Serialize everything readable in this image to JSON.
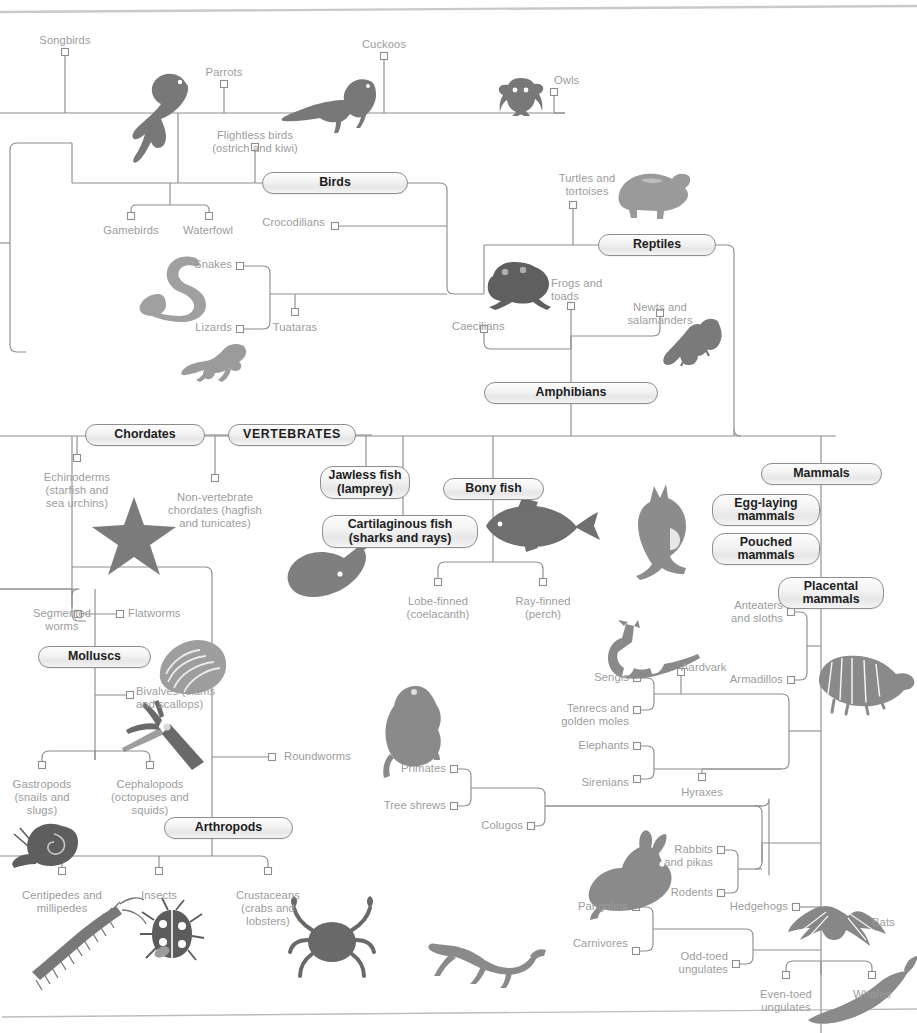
{
  "diagram": {
    "type": "cladogram",
    "colors": {
      "line": "#8e8e8e",
      "leaf_text": "#9c9c9c",
      "pill_text": "#1d1d1d",
      "pill_border": "#8e8e8e",
      "silhouette_dark": "#6e6e6e",
      "silhouette_light": "#a8a8a8",
      "page_rule": "#b9b9b9",
      "background": "#ffffff"
    }
  },
  "clades": [
    {
      "id": "birds",
      "label": "Birds",
      "x": 262,
      "y": 172,
      "w": 146,
      "h": 22
    },
    {
      "id": "reptiles",
      "label": "Reptiles",
      "x": 598,
      "y": 234,
      "w": 118,
      "h": 22
    },
    {
      "id": "amphibians",
      "label": "Amphibians",
      "x": 484,
      "y": 382,
      "w": 174,
      "h": 22
    },
    {
      "id": "chordates",
      "label": "Chordates",
      "x": 85,
      "y": 424,
      "w": 120,
      "h": 22
    },
    {
      "id": "vertebrates",
      "label": "VERTEBRATES",
      "x": 228,
      "y": 424,
      "w": 128,
      "h": 22
    },
    {
      "id": "jawless",
      "label": "Jawless fish\n(lamprey)",
      "x": 320,
      "y": 466,
      "w": 90,
      "h": 33
    },
    {
      "id": "cartilaginous",
      "label": "Cartilaginous fish\n(sharks and rays)",
      "x": 322,
      "y": 515,
      "w": 156,
      "h": 33
    },
    {
      "id": "bony",
      "label": "Bony fish",
      "x": 443,
      "y": 478,
      "w": 101,
      "h": 22
    },
    {
      "id": "mammals",
      "label": "Mammals",
      "x": 761,
      "y": 463,
      "w": 121,
      "h": 22
    },
    {
      "id": "egglaying",
      "label": "Egg-laying\nmammals",
      "x": 712,
      "y": 494,
      "w": 108,
      "h": 32
    },
    {
      "id": "pouched",
      "label": "Pouched\nmammals",
      "x": 712,
      "y": 533,
      "w": 108,
      "h": 32
    },
    {
      "id": "placental",
      "label": "Placental\nmammals",
      "x": 778,
      "y": 577,
      "w": 106,
      "h": 32
    },
    {
      "id": "molluscs",
      "label": "Molluscs",
      "x": 38,
      "y": 646,
      "w": 113,
      "h": 22
    },
    {
      "id": "arthropods",
      "label": "Arthropods",
      "x": 164,
      "y": 817,
      "w": 129,
      "h": 22
    }
  ],
  "leaves": [
    {
      "id": "songbirds",
      "label": "Songbirds",
      "x": 65,
      "y": 34,
      "align": "c"
    },
    {
      "id": "parrots",
      "label": "Parrots",
      "x": 224,
      "y": 66,
      "align": "c"
    },
    {
      "id": "cuckoos",
      "label": "Cuckoos",
      "x": 384,
      "y": 38,
      "align": "c"
    },
    {
      "id": "owls",
      "label": "Owls",
      "x": 554,
      "y": 74,
      "align": "l"
    },
    {
      "id": "flightless-birds",
      "label": "Flightless birds\n(ostrich and kiwi)",
      "x": 255,
      "y": 129,
      "align": "c"
    },
    {
      "id": "gamebirds",
      "label": "Gamebirds",
      "x": 131,
      "y": 224,
      "align": "c"
    },
    {
      "id": "waterfowl",
      "label": "Waterfowl",
      "x": 208,
      "y": 224,
      "align": "c"
    },
    {
      "id": "crocodilians",
      "label": "Crocodilians",
      "x": 325,
      "y": 216,
      "align": "r"
    },
    {
      "id": "snakes",
      "label": "Snakes",
      "x": 232,
      "y": 258,
      "align": "r"
    },
    {
      "id": "lizards",
      "label": "Lizards",
      "x": 232,
      "y": 321,
      "align": "r"
    },
    {
      "id": "tuataras",
      "label": "Tuataras",
      "x": 295,
      "y": 321,
      "align": "c"
    },
    {
      "id": "turtles",
      "label": "Turtles and\ntortoises",
      "x": 587,
      "y": 172,
      "align": "c"
    },
    {
      "id": "frogs",
      "label": "Frogs and\ntoads",
      "x": 551,
      "y": 277,
      "align": "l"
    },
    {
      "id": "newts",
      "label": "Newts and\nsalamanders",
      "x": 660,
      "y": 301,
      "align": "c"
    },
    {
      "id": "caecilians",
      "label": "Caecilians",
      "x": 452,
      "y": 320,
      "align": "l"
    },
    {
      "id": "echinoderms",
      "label": "Echinoderms\n(starfish and\nsea urchins)",
      "x": 77,
      "y": 471,
      "align": "c"
    },
    {
      "id": "non-vertebrate",
      "label": "Non-vertebrate\nchordates (hagfish\nand tunicates)",
      "x": 215,
      "y": 491,
      "align": "c"
    },
    {
      "id": "lobe-finned",
      "label": "Lobe-finned\n(coelacanth)",
      "x": 438,
      "y": 595,
      "align": "c"
    },
    {
      "id": "ray-finned",
      "label": "Ray-finned\n(perch)",
      "x": 543,
      "y": 595,
      "align": "c"
    },
    {
      "id": "segmented-worms",
      "label": "Segmented\nworms",
      "x": 62,
      "y": 607,
      "align": "c"
    },
    {
      "id": "flatworms",
      "label": "Flatworms",
      "x": 128,
      "y": 607,
      "align": "l"
    },
    {
      "id": "bivalves",
      "label": "Bivalves (clams\nand scallops)",
      "x": 136,
      "y": 685,
      "align": "l"
    },
    {
      "id": "roundworms",
      "label": "Roundworms",
      "x": 284,
      "y": 750,
      "align": "l"
    },
    {
      "id": "gastropods",
      "label": "Gastropods\n(snails and\nslugs)",
      "x": 42,
      "y": 778,
      "align": "c"
    },
    {
      "id": "cephalopods",
      "label": "Cephalopods\n(octopuses and\nsquids)",
      "x": 150,
      "y": 778,
      "align": "c"
    },
    {
      "id": "centipedes",
      "label": "Centipedes and\nmillipedes",
      "x": 62,
      "y": 889,
      "align": "c"
    },
    {
      "id": "insects",
      "label": "Insects",
      "x": 159,
      "y": 889,
      "align": "c"
    },
    {
      "id": "crustaceans",
      "label": "Crustaceans\n(crabs and\nlobsters)",
      "x": 268,
      "y": 889,
      "align": "c"
    },
    {
      "id": "anteaters",
      "label": "Anteaters\nand sloths",
      "x": 783,
      "y": 599,
      "align": "r"
    },
    {
      "id": "aardvark",
      "label": "Aardvark",
      "x": 681,
      "y": 661,
      "align": "l"
    },
    {
      "id": "armadillos",
      "label": "Armadillos",
      "x": 783,
      "y": 673,
      "align": "r"
    },
    {
      "id": "sengis",
      "label": "Sengis",
      "x": 629,
      "y": 671,
      "align": "r"
    },
    {
      "id": "tenrecs",
      "label": "Tenrecs and\ngolden moles",
      "x": 629,
      "y": 702,
      "align": "r"
    },
    {
      "id": "elephants",
      "label": "Elephants",
      "x": 629,
      "y": 739,
      "align": "r"
    },
    {
      "id": "sirenians",
      "label": "Sirenians",
      "x": 629,
      "y": 776,
      "align": "r"
    },
    {
      "id": "hyraxes",
      "label": "Hyraxes",
      "x": 702,
      "y": 786,
      "align": "c"
    },
    {
      "id": "primates",
      "label": "Primates",
      "x": 446,
      "y": 762,
      "align": "r"
    },
    {
      "id": "tree-shrews",
      "label": "Tree shrews",
      "x": 446,
      "y": 799,
      "align": "r"
    },
    {
      "id": "colugos",
      "label": "Colugos",
      "x": 523,
      "y": 819,
      "align": "r"
    },
    {
      "id": "rabbits",
      "label": "Rabbits\nand pikas",
      "x": 713,
      "y": 843,
      "align": "r"
    },
    {
      "id": "rodents",
      "label": "Rodents",
      "x": 713,
      "y": 886,
      "align": "r"
    },
    {
      "id": "pangolins",
      "label": "Pangolins",
      "x": 628,
      "y": 900,
      "align": "r"
    },
    {
      "id": "carnivores",
      "label": "Carnivores",
      "x": 628,
      "y": 937,
      "align": "r"
    },
    {
      "id": "hedgehogs",
      "label": "Hedgehogs",
      "x": 788,
      "y": 900,
      "align": "r"
    },
    {
      "id": "bats",
      "label": "Bats",
      "x": 872,
      "y": 916,
      "align": "l"
    },
    {
      "id": "odd-toed",
      "label": "Odd-toed\nungulates",
      "x": 728,
      "y": 950,
      "align": "r"
    },
    {
      "id": "even-toed",
      "label": "Even-toed\nungulates",
      "x": 786,
      "y": 988,
      "align": "c"
    },
    {
      "id": "whales",
      "label": "Whales",
      "x": 872,
      "y": 988,
      "align": "c"
    }
  ],
  "silhouettes": [
    {
      "id": "parrot-silhouette",
      "name": "parrot"
    },
    {
      "id": "cuckoo-silhouette",
      "name": "cuckoo"
    },
    {
      "id": "owl-silhouette",
      "name": "owl"
    },
    {
      "id": "snake-silhouette",
      "name": "snake"
    },
    {
      "id": "lizard-silhouette",
      "name": "lizard"
    },
    {
      "id": "tortoise-silhouette",
      "name": "tortoise"
    },
    {
      "id": "frog-silhouette",
      "name": "frog"
    },
    {
      "id": "salamander-silhouette",
      "name": "salamander"
    },
    {
      "id": "starfish-silhouette",
      "name": "starfish"
    },
    {
      "id": "ray-silhouette",
      "name": "stingray"
    },
    {
      "id": "perch-silhouette",
      "name": "perch"
    },
    {
      "id": "kangaroo-silhouette",
      "name": "kangaroo"
    },
    {
      "id": "clam-silhouette",
      "name": "clam-shell"
    },
    {
      "id": "squid-silhouette",
      "name": "squid"
    },
    {
      "id": "snail-silhouette",
      "name": "snail"
    },
    {
      "id": "centipede-silhouette",
      "name": "centipede"
    },
    {
      "id": "ladybird-silhouette",
      "name": "ladybird-beetle"
    },
    {
      "id": "crab-silhouette",
      "name": "crab"
    },
    {
      "id": "aardvark-silhouette",
      "name": "aardvark"
    },
    {
      "id": "armadillo-silhouette",
      "name": "armadillo"
    },
    {
      "id": "monkey-silhouette",
      "name": "monkey"
    },
    {
      "id": "rabbit-silhouette",
      "name": "rabbit"
    },
    {
      "id": "bat-silhouette",
      "name": "bat"
    },
    {
      "id": "cheetah-silhouette",
      "name": "cheetah"
    },
    {
      "id": "whale-silhouette",
      "name": "whale"
    }
  ]
}
